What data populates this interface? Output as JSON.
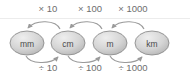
{
  "diagram": {
    "colors": {
      "node_fill_light": "#e8e8e8",
      "node_fill_dark": "#b4b4b4",
      "node_stroke": "#8d8d8d",
      "node_text": "#4a4a4a",
      "label_text": "#6e6e6e",
      "arrow": "#9a9a9a",
      "rule": "#ececec",
      "background": "#ffffff"
    },
    "nodes": [
      {
        "id": "mm",
        "label": "mm",
        "cx": 27,
        "cy": 43,
        "rx": 17,
        "ry": 12
      },
      {
        "id": "cm",
        "label": "cm",
        "cx": 68,
        "cy": 43,
        "rx": 17,
        "ry": 12
      },
      {
        "id": "m",
        "label": "m",
        "cx": 110,
        "cy": 43,
        "rx": 17,
        "ry": 12
      },
      {
        "id": "km",
        "label": "km",
        "cx": 152,
        "cy": 43,
        "rx": 17,
        "ry": 12
      }
    ],
    "multiply_labels": [
      {
        "id": "mul-10",
        "text": "× 10",
        "x": 48,
        "y": 12
      },
      {
        "id": "mul-100",
        "text": "× 100",
        "x": 90,
        "y": 12
      },
      {
        "id": "mul-1000",
        "text": "× 1000",
        "x": 133,
        "y": 12
      }
    ],
    "divide_labels": [
      {
        "id": "div-10",
        "text": "÷ 10",
        "x": 48,
        "y": 71
      },
      {
        "id": "div-100",
        "text": "÷ 100",
        "x": 90,
        "y": 71
      },
      {
        "id": "div-1000",
        "text": "÷ 1000",
        "x": 133,
        "y": 71
      }
    ],
    "top_arrows": [
      {
        "id": "arrow-cm-to-mm",
        "from": "cm",
        "to": "mm",
        "direction": "left",
        "d": "M 60 29 C 56 20, 36 19, 28 28"
      },
      {
        "id": "arrow-m-to-cm",
        "from": "m",
        "to": "cm",
        "direction": "left",
        "d": "M 102 29 C 98 20, 78 19, 70 28"
      },
      {
        "id": "arrow-km-to-m",
        "from": "km",
        "to": "m",
        "direction": "left",
        "d": "M 144 29 C 140 20, 120 19, 112 28"
      }
    ],
    "bottom_arrows": [
      {
        "id": "arrow-mm-to-cm",
        "from": "mm",
        "to": "cm",
        "direction": "right",
        "d": "M 26 56 C 30 64, 50 65, 58 57"
      },
      {
        "id": "arrow-cm-to-m",
        "from": "cm",
        "to": "m",
        "direction": "right",
        "d": "M 68 56 C 72 64, 92 65, 100 57"
      },
      {
        "id": "arrow-m-to-km",
        "from": "m",
        "to": "km",
        "direction": "right",
        "d": "M 110 56 C 114 64, 134 65, 142 57"
      }
    ],
    "rule": {
      "id": "horizontal-rule",
      "x1": 0,
      "y1": 18.5,
      "x2": 190,
      "y2": 18.5
    }
  }
}
